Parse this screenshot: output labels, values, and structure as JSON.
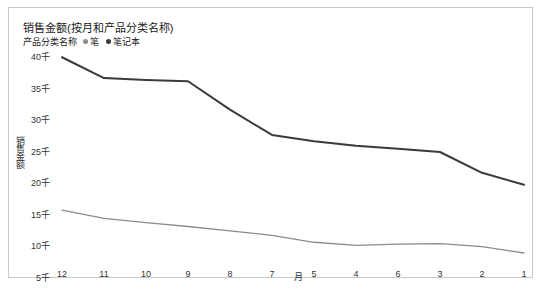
{
  "chart_title": "销售金额(按月和产品分类名称)",
  "legend": {
    "title": "产品分类名称",
    "entries": [
      {
        "label": "笔",
        "color": "#8c8c8c"
      },
      {
        "label": "笔记本",
        "color": "#3a3a3a"
      }
    ]
  },
  "axes": {
    "y_title": "销售金额",
    "x_title": "月",
    "y_ticks": [
      "40千",
      "35千",
      "30千",
      "25千",
      "20千",
      "15千",
      "10千",
      "5千"
    ],
    "x_ticks": [
      "12",
      "11",
      "10",
      "9",
      "8",
      "7",
      "5",
      "4",
      "6",
      "3",
      "2",
      "1"
    ]
  },
  "chart_data": {
    "type": "line",
    "title": "销售金额(按月和产品分类名称)",
    "xlabel": "月",
    "ylabel": "销售金额",
    "categories": [
      "12",
      "11",
      "10",
      "9",
      "8",
      "7",
      "5",
      "4",
      "6",
      "3",
      "2",
      "1"
    ],
    "ylim": [
      5000,
      40000
    ],
    "y_tick_values": [
      40000,
      35000,
      30000,
      25000,
      20000,
      15000,
      10000,
      5000
    ],
    "y_tick_labels": [
      "40千",
      "35千",
      "30千",
      "25千",
      "20千",
      "15千",
      "10千",
      "5千"
    ],
    "grid": false,
    "legend_position": "top-left",
    "series": [
      {
        "name": "笔记本",
        "color": "#3a3a3a",
        "values": [
          39800,
          36500,
          36200,
          36000,
          31500,
          27500,
          26500,
          25800,
          25300,
          24800,
          21500,
          19600
        ]
      },
      {
        "name": "笔",
        "color": "#8c8c8c",
        "values": [
          15600,
          14300,
          13600,
          13000,
          12300,
          11600,
          10500,
          10000,
          10200,
          10300,
          9800,
          8800
        ]
      }
    ]
  }
}
